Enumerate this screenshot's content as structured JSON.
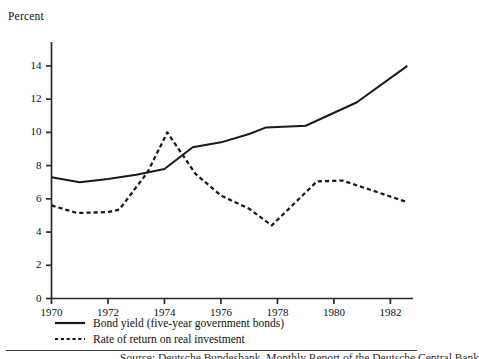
{
  "chart_data": {
    "type": "line",
    "title": "",
    "ylabel": "Percent",
    "xlabel": "",
    "xlim": [
      1970,
      1982.8
    ],
    "ylim": [
      0,
      15.2
    ],
    "grid": false,
    "legend_position": "below-axis-left",
    "y_ticks": [
      0,
      2,
      4,
      6,
      8,
      10,
      12,
      14
    ],
    "y_tick_labels": [
      "0",
      "2",
      "4",
      "6",
      "8",
      "10",
      "12",
      "14"
    ],
    "x_ticks": [
      1970,
      1972,
      1974,
      1976,
      1978,
      1980,
      1982
    ],
    "x_tick_labels": [
      "1970",
      "1972",
      "1974",
      "1976",
      "1978",
      "1980",
      "1982"
    ],
    "series": [
      {
        "name": "Bond yield (five-year government bonds)",
        "style": "solid",
        "color": "#1a1a1a",
        "x": [
          1970,
          1971,
          1972,
          1973,
          1974,
          1975,
          1976,
          1977,
          1977.6,
          1979,
          1980.8,
          1982.6
        ],
        "values": [
          7.3,
          7.0,
          7.2,
          7.45,
          7.8,
          9.1,
          9.4,
          9.9,
          10.3,
          10.4,
          11.8,
          14.0
        ]
      },
      {
        "name": "Rate of return on real investment",
        "style": "dashed",
        "color": "#1a1a1a",
        "x": [
          1970,
          1970.9,
          1972,
          1972.4,
          1973.4,
          1974.1,
          1975.1,
          1976,
          1977,
          1977.8,
          1979.4,
          1980.3,
          1982.6
        ],
        "values": [
          5.6,
          5.15,
          5.2,
          5.35,
          7.6,
          10.0,
          7.5,
          6.2,
          5.4,
          4.4,
          7.05,
          7.1,
          5.8
        ]
      }
    ],
    "legend_entries": [
      "Bond yield (five-year government bonds)",
      "Rate of return on real investment"
    ]
  },
  "source": {
    "text": "Source: Deutsche Bundesbank, Monthly Report of the Deutsche Central Bank"
  }
}
